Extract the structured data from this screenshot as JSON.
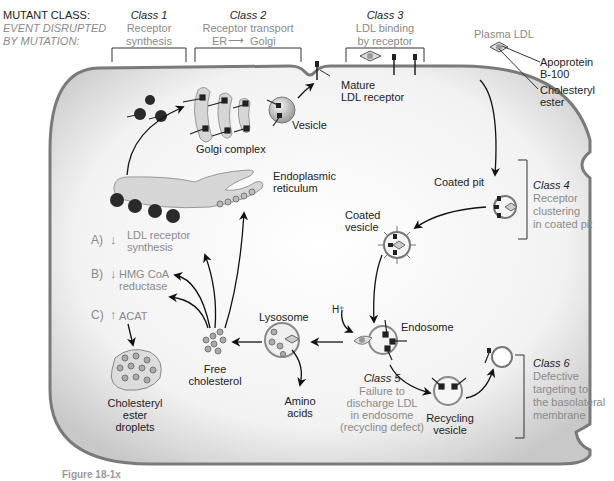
{
  "header": {
    "mutant_class_label": "MUTANT CLASS:",
    "event_label_line1": "EVENT DISRUPTED",
    "event_label_line2": "BY MUTATION:"
  },
  "classes": [
    {
      "title": "Class 1",
      "line1": "Receptor",
      "line2": "synthesis"
    },
    {
      "title": "Class 2",
      "line1": "Receptor transport",
      "line2_left": "ER",
      "line2_right": "Golgi"
    },
    {
      "title": "Class 3",
      "line1": "LDL binding",
      "line2": "by receptor"
    },
    {
      "title": "Class 4",
      "line1": "Receptor",
      "line2": "clustering",
      "line3": "in coated pit"
    },
    {
      "title": "Class 5",
      "line1": "Failure to",
      "line2": "discharge LDL",
      "line3": "in endosome",
      "line4": "(recycling defect)"
    },
    {
      "title": "Class 6",
      "line1": "Defective",
      "line2": "targeting to",
      "line3": "the basolateral",
      "line4": "membrane"
    }
  ],
  "legend": {
    "plasma_ldl": "Plasma LDL",
    "apoprotein_line1": "Apoprotein",
    "apoprotein_line2": "B-100",
    "cholesteryl_line1": "Cholesteryl",
    "cholesteryl_line2": "ester"
  },
  "structures": {
    "mature_receptor_line1": "Mature",
    "mature_receptor_line2": "LDL receptor",
    "vesicle": "Vesicle",
    "golgi": "Golgi complex",
    "er_line1": "Endoplasmic",
    "er_line2": "reticulum",
    "coated_pit": "Coated pit",
    "coated_vesicle_line1": "Coated",
    "coated_vesicle_line2": "vesicle",
    "h_plus": "H⁺",
    "endosome": "Endosome",
    "lysosome": "Lysosome",
    "amino_line1": "Amino",
    "amino_line2": "acids",
    "free_chol_line1": "Free",
    "free_chol_line2": "cholesterol",
    "recycling_line1": "Recycling",
    "recycling_line2": "vesicle",
    "droplets_line1": "Cholesteryl",
    "droplets_line2": "ester",
    "droplets_line3": "droplets"
  },
  "regulation": [
    {
      "letter": "A)",
      "arrow": "↓",
      "line1": "LDL receptor",
      "line2": "synthesis"
    },
    {
      "letter": "B)",
      "arrow": "↓",
      "line1": "HMG CoA",
      "line2": "reductase"
    },
    {
      "letter": "C)",
      "arrow": "↑",
      "line1": "ACAT",
      "line2": ""
    }
  ],
  "caption": "Figure 18-1x",
  "colors": {
    "membrane": "#7a7a7a",
    "cytoplasm": "#e4e4e4",
    "organelle_fill": "#d9d9d9",
    "dark_ribosome": "#2a2a2a",
    "gray_text": "#8a8a8a"
  }
}
